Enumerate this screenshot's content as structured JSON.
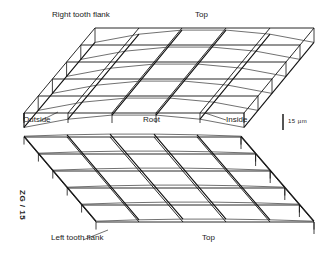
{
  "labels": {
    "right_flank": "Right tooth flank",
    "top_upper": "Top",
    "outside": "Outside",
    "root": "Root",
    "inside": "Inside",
    "scale": "15 µm",
    "left_flank": "Left tooth flank",
    "top_lower": "Top",
    "figure_id": "ZG / 15"
  },
  "colors": {
    "line": "#111111",
    "curve": "#333333",
    "background": "#ffffff"
  },
  "upper_grid": {
    "back_row": {
      "y": 28,
      "x": [
        95,
        139,
        182,
        226,
        270,
        314
      ]
    },
    "front_row": {
      "y": 113,
      "x": [
        24,
        68,
        112,
        156,
        200,
        244
      ]
    },
    "rows": 5,
    "box_height": 16
  },
  "lower_grid": {
    "back_row": {
      "y": 137,
      "x": [
        24,
        67,
        110,
        154,
        197,
        241
      ]
    },
    "front_row": {
      "y": 222,
      "x": [
        96,
        139,
        183,
        226,
        270,
        314
      ]
    },
    "rows": 5,
    "box_height": 14
  }
}
